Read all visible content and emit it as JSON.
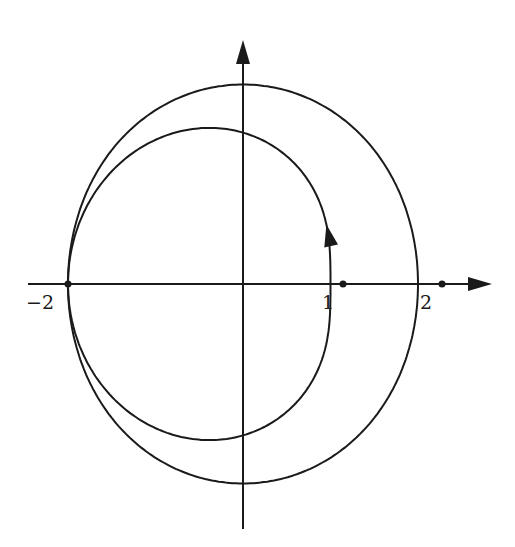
{
  "figure": {
    "colors": {
      "stroke": "#1a1a1a",
      "background": "#ffffff"
    },
    "labels": {
      "x_neg2": "−2",
      "x_1": "1",
      "x_2": "2"
    }
  },
  "chart_data": {
    "type": "diagram",
    "title": "",
    "axes": {
      "origin_px": [
        243,
        284
      ],
      "unit_px": 87.5,
      "x_axis_px": {
        "from": 28,
        "to": 492
      },
      "y_axis_px": {
        "from": 529,
        "to": 40
      },
      "arrowheads": [
        "x-positive",
        "y-positive"
      ]
    },
    "tick_labels": [
      {
        "value": -2,
        "text": "−2"
      },
      {
        "value": 1,
        "text": "1"
      },
      {
        "value": 2,
        "text": "2"
      }
    ],
    "marked_points": [
      [
        -2,
        0
      ],
      [
        1,
        0
      ],
      [
        2,
        0
      ]
    ],
    "curves": [
      {
        "name": "outer",
        "shape": "closed",
        "x_extent": [
          -2,
          2
        ],
        "y_extent": [
          -2.27,
          2.28
        ]
      },
      {
        "name": "inner",
        "shape": "closed-loop-through-(1,0)-and-(-2,0)",
        "x_extent": [
          -2,
          1.15
        ],
        "y_extent": [
          -1.71,
          1.73
        ],
        "direction_arrow_at": [
          1.12,
          0.8
        ],
        "direction": "counterclockwise"
      }
    ]
  }
}
